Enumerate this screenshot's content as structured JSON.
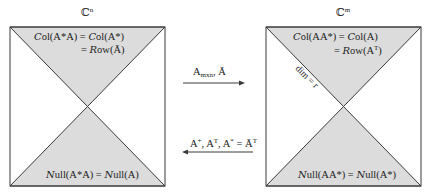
{
  "colors": {
    "region_fill": "#dcdcdc",
    "stroke": "#3a3a3a",
    "background": "#ffffff"
  },
  "left_space": {
    "title": "ℂⁿ",
    "top_label_line1": "Col(A*A) = Col(A*)",
    "top_label_line2": "= Row(Ā)",
    "bottom_label": "Null(A*A) = Null(A)"
  },
  "right_space": {
    "title": "ℂᵐ",
    "top_label_line1": "Col(AA*) = Col(A)",
    "top_label_line2": "= Row(Aᵀ)",
    "diagonal_label": "dim = r",
    "bottom_label": "Null(AA*) = Null(A*)"
  },
  "arrows": {
    "forward": {
      "label": "Aₘₓₙ, Ā",
      "direction": "right"
    },
    "backward": {
      "label": "A⁺, Aᵀ, A* = Āᵀ",
      "direction": "left"
    }
  }
}
